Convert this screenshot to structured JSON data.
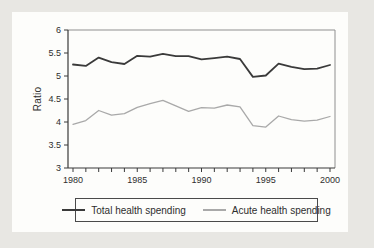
{
  "chart_data": {
    "type": "line",
    "title": "",
    "xlabel": "",
    "ylabel": "Ratio",
    "ylim": [
      3,
      6
    ],
    "xlim": [
      1980,
      2000
    ],
    "yticks": [
      3,
      3.5,
      4,
      4.5,
      5,
      5.5,
      6
    ],
    "xticks_labeled": [
      1980,
      1985,
      1990,
      1995,
      2000
    ],
    "xtick_minor_every_year": true,
    "grid": false,
    "legend_position": "bottom-boxed",
    "x": [
      1980,
      1981,
      1982,
      1983,
      1984,
      1985,
      1986,
      1987,
      1988,
      1989,
      1990,
      1991,
      1992,
      1993,
      1994,
      1995,
      1996,
      1997,
      1998,
      1999,
      2000
    ],
    "series": [
      {
        "name": "Total health spending",
        "color": "#3a3a3a",
        "width": 1.8,
        "values": [
          5.25,
          5.22,
          5.4,
          5.3,
          5.26,
          5.44,
          5.42,
          5.48,
          5.43,
          5.43,
          5.36,
          5.39,
          5.42,
          5.37,
          4.98,
          5.01,
          5.27,
          5.2,
          5.15,
          5.16,
          5.24
        ]
      },
      {
        "name": "Acute health spending",
        "color": "#a9a9a9",
        "width": 1.3,
        "values": [
          3.95,
          4.03,
          4.25,
          4.15,
          4.18,
          4.32,
          4.4,
          4.47,
          4.35,
          4.23,
          4.31,
          4.3,
          4.37,
          4.33,
          3.92,
          3.89,
          4.13,
          4.05,
          4.02,
          4.04,
          4.12
        ]
      }
    ],
    "style": {
      "axis_color": "#3a3a3a",
      "frame_color": "#8f8f8f",
      "text_color": "#2e2e2e",
      "page_bg": "#e8e7e3",
      "panel_bg": "#fdfdfb",
      "legend_border": "#4a4a4a",
      "tick_font_size": 9
    }
  }
}
